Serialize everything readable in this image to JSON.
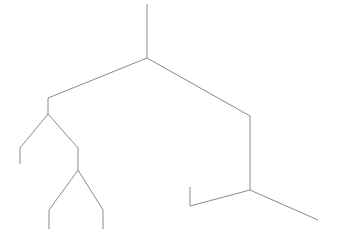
{
  "diagram": {
    "type": "truth-tree",
    "line_color": "#8a8a8a",
    "text_color": "#222222",
    "check_glyph": "✓",
    "closed_label": "Cl",
    "premises": [
      {
        "formula": "p ∨ (q & s)",
        "checked": true
      },
      {
        "formula": "p → q",
        "checked": true
      },
      {
        "formula": "q & r",
        "checked": true
      }
    ],
    "left_branch": {
      "node": "p",
      "children": [
        {
          "node": "p",
          "closed": true
        },
        {
          "node": "q",
          "children": [
            {
              "node": "q",
              "closed": true
            },
            {
              "node": "r",
              "closed": false
            }
          ]
        }
      ]
    },
    "right_branch": {
      "nodes": [
        {
          "formula": "q & s",
          "checked": true
        },
        {
          "formula": "q"
        },
        {
          "formula": "s"
        }
      ],
      "children": [
        {
          "node": "p",
          "children": [
            {
              "node": "q",
              "closed": true
            },
            {
              "node": "r",
              "closed": false
            }
          ]
        },
        {
          "node": "q",
          "children": [
            {
              "node": "q",
              "closed": true
            },
            {
              "node": "r",
              "closed": false
            }
          ]
        }
      ]
    }
  }
}
